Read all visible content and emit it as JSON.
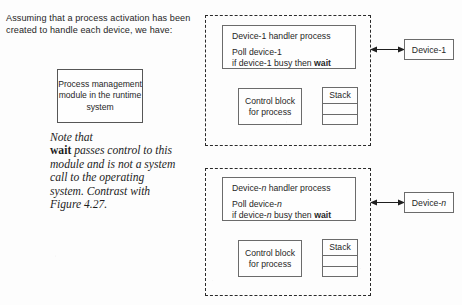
{
  "figure": {
    "intro_text": "Assuming that a process activation has been created to handle each device, we have:",
    "process_module": {
      "label": "Process management module in the runtime system"
    },
    "note": {
      "line_1": "Note that",
      "emphasis": "wait",
      "line_2": " passes control to this module and is not a system call to the operating system. Contrast with Figure 4.27."
    },
    "groups": [
      {
        "name": "device-1-activation",
        "handler": {
          "title": "Device-1 handler process",
          "poll_line": "Poll device-1",
          "condition_prefix": "if device-1 busy then ",
          "condition_keyword": "wait"
        },
        "control_block": {
          "line_1": "Control block",
          "line_2": "for process"
        },
        "stack": {
          "label": "Stack",
          "rows": 2
        },
        "device": {
          "label": "Device-1"
        },
        "connector": {
          "type": "double-headed-arrow"
        }
      },
      {
        "name": "device-n-activation",
        "handler": {
          "title_prefix": "Device-",
          "title_italic": "n",
          "title_suffix": " handler process",
          "poll_prefix": "Poll device-",
          "poll_italic": "n",
          "condition_prefix": "if device-",
          "condition_italic": "n",
          "condition_mid": " busy then ",
          "condition_keyword": "wait"
        },
        "control_block": {
          "line_1": "Control block",
          "line_2": "for process"
        },
        "stack": {
          "label": "Stack",
          "rows": 2
        },
        "device": {
          "label_prefix": "Device-",
          "label_italic": "n"
        },
        "connector": {
          "type": "double-headed-arrow"
        }
      }
    ],
    "colors": {
      "background": "#fdfdfd",
      "ink": "#262626",
      "box_border": "#6b6b6b",
      "dashed_border": "#2a2a2a"
    }
  }
}
